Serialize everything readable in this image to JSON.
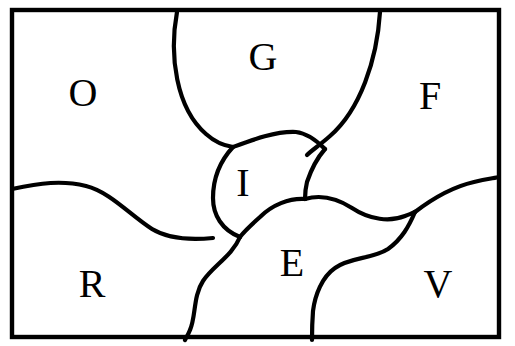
{
  "figure": {
    "width": 515,
    "height": 346,
    "background_color": "#ffffff",
    "line_color": "#000000",
    "label_font_style": "serif",
    "label_font_size_px": 40
  },
  "frame": {
    "name": "outer-border",
    "x": 12,
    "y": 10,
    "width": 487,
    "height": 327,
    "stroke_width": 4.4
  },
  "regions": [
    {
      "id": "O",
      "label": "O",
      "label_x": 83,
      "label_y": 93,
      "name": "region-o"
    },
    {
      "id": "G",
      "label": "G",
      "label_x": 263,
      "label_y": 57,
      "name": "region-g"
    },
    {
      "id": "F",
      "label": "F",
      "label_x": 430,
      "label_y": 96,
      "name": "region-f"
    },
    {
      "id": "I",
      "label": "I",
      "label_x": 243,
      "label_y": 183,
      "name": "region-i"
    },
    {
      "id": "R",
      "label": "R",
      "label_x": 92,
      "label_y": 284,
      "name": "region-r"
    },
    {
      "id": "E",
      "label": "E",
      "label_x": 292,
      "label_y": 263,
      "name": "region-e"
    },
    {
      "id": "V",
      "label": "V",
      "label_x": 438,
      "label_y": 284,
      "name": "region-v"
    }
  ],
  "boundaries": [
    {
      "id": "g-left",
      "name": "boundary-o-g",
      "between": [
        "O",
        "G"
      ],
      "path": "M 177 12 C 169 55, 176 108, 206 134 C 216 143, 226 146, 233 147"
    },
    {
      "id": "g-right",
      "name": "boundary-g-f",
      "between": [
        "G",
        "F"
      ],
      "path": "M 380 12 C 377 60, 360 110, 330 136 C 320 145, 312 150, 307 155"
    },
    {
      "id": "lens-top",
      "name": "boundary-i-upper",
      "between": [
        "I",
        "G"
      ],
      "path": "M 233 147 C 252 140, 276 131, 296 132 C 306 133, 316 140, 325 149"
    },
    {
      "id": "f-i-e",
      "name": "boundary-f-vertical",
      "between": [
        "F",
        "I"
      ],
      "path": "M 325 149 C 318 157, 311 170, 307 182 C 305 190, 305 195, 305 199"
    },
    {
      "id": "lens-left",
      "name": "boundary-i-r",
      "between": [
        "I",
        "O",
        "R"
      ],
      "path": "M 233 147 C 221 160, 213 178, 213 198 C 213 215, 222 230, 240 237"
    },
    {
      "id": "lens-right",
      "name": "boundary-i-e",
      "between": [
        "I",
        "E"
      ],
      "path": "M 305 199 C 289 198, 272 205, 260 217 C 250 226, 243 233, 240 237"
    },
    {
      "id": "o-r-wave",
      "name": "boundary-o-r",
      "between": [
        "O",
        "R"
      ],
      "path": "M 12 189 C 40 183, 62 180, 86 186 C 110 192, 130 215, 152 229 C 170 240, 193 240, 213 238"
    },
    {
      "id": "r-e",
      "name": "boundary-r-e",
      "between": [
        "R",
        "E"
      ],
      "path": "M 240 237 C 232 256, 213 266, 203 281 C 193 296, 196 317, 190 330 C 188 335, 186 338, 185 340"
    },
    {
      "id": "e-f-upper",
      "name": "boundary-e-f",
      "between": [
        "E",
        "F"
      ],
      "path": "M 305 199 C 322 194, 338 199, 352 208 C 370 220, 390 222, 405 216 C 410 214, 413 213, 415 212"
    },
    {
      "id": "f-v",
      "name": "boundary-f-v",
      "between": [
        "F",
        "V"
      ],
      "path": "M 415 212 C 432 199, 452 187, 474 182 C 487 179, 495 178, 499 177"
    },
    {
      "id": "e-v",
      "name": "boundary-e-v",
      "between": [
        "E",
        "V"
      ],
      "path": "M 415 212 C 409 226, 402 239, 388 249 C 373 259, 350 257, 335 268 C 322 277, 315 295, 313 311 C 312 324, 312 333, 312 340"
    }
  ]
}
